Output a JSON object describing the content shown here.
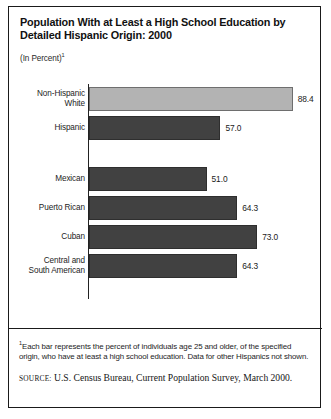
{
  "figure": {
    "title": "Population With at Least a High School Education by\nDetailed Hispanic Origin: 2000",
    "subtitle": "(In Percent)",
    "subtitle_footnote_marker": "1",
    "footnote_marker": "1",
    "footnote": "Each bar represents the percent of individuals age 25 and older, of the specified origin, who have at least a high school education. Data for other Hispanics not shown.",
    "source_label": "Source:",
    "source_text": "U.S. Census Bureau, Current Population Survey, March 2000."
  },
  "chart_data": {
    "type": "bar",
    "orientation": "horizontal",
    "title": "Population With at Least a High School Education by Detailed Hispanic Origin: 2000",
    "xlabel": "",
    "ylabel": "",
    "unit": "percent",
    "xlim": [
      0,
      100
    ],
    "grid": false,
    "legend": "none",
    "categories": [
      "Non-Hispanic White",
      "Hispanic",
      "Mexican",
      "Puerto Rican",
      "Cuban",
      "Central and South American"
    ],
    "values": [
      88.4,
      57.0,
      51.0,
      64.3,
      73.0,
      64.3
    ],
    "bars": [
      {
        "label": "Non-Hispanic\nWhite",
        "value": 88.4,
        "value_text": "88.4",
        "color": "#b3b3b3",
        "group": "total"
      },
      {
        "label": "Hispanic",
        "value": 57.0,
        "value_text": "57.0",
        "color": "#414141",
        "group": "total"
      },
      {
        "label": "Mexican",
        "value": 51.0,
        "value_text": "51.0",
        "color": "#414141",
        "group": "detail"
      },
      {
        "label": "Puerto Rican",
        "value": 64.3,
        "value_text": "64.3",
        "color": "#414141",
        "group": "detail"
      },
      {
        "label": "Cuban",
        "value": 73.0,
        "value_text": "73.0",
        "color": "#414141",
        "group": "detail"
      },
      {
        "label": "Central and\nSouth American",
        "value": 64.3,
        "value_text": "64.3",
        "color": "#414141",
        "group": "detail"
      }
    ],
    "colors": {
      "non_hispanic_white_bar": "#b3b3b3",
      "hispanic_bars": "#414141",
      "axis": "#222222",
      "frame": "#1a1a1a"
    }
  }
}
